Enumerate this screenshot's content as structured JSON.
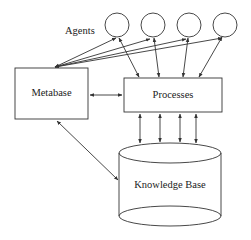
{
  "diagram": {
    "title": "",
    "nodes": {
      "agents_label": "Agents",
      "metabase": "Metabase",
      "processes": "Processes",
      "knowledge_base": "Knowledge Base"
    },
    "agents_count": 4,
    "edges": [
      {
        "from": "Metabase",
        "to": "Agent 1",
        "bidirectional": true
      },
      {
        "from": "Metabase",
        "to": "Agent 2",
        "bidirectional": true
      },
      {
        "from": "Metabase",
        "to": "Agent 3",
        "bidirectional": true
      },
      {
        "from": "Metabase",
        "to": "Agent 4",
        "bidirectional": true
      },
      {
        "from": "Agent 1",
        "to": "Processes",
        "bidirectional": true
      },
      {
        "from": "Agent 2",
        "to": "Processes",
        "bidirectional": true
      },
      {
        "from": "Agent 3",
        "to": "Processes",
        "bidirectional": true
      },
      {
        "from": "Agent 4",
        "to": "Processes",
        "bidirectional": true
      },
      {
        "from": "Metabase",
        "to": "Processes",
        "bidirectional": true
      },
      {
        "from": "Processes",
        "to": "Knowledge Base",
        "bidirectional": true,
        "count": 4
      },
      {
        "from": "Metabase",
        "to": "Knowledge Base",
        "bidirectional": true
      }
    ],
    "colors": {
      "stroke": "#333333",
      "background": "#ffffff"
    }
  }
}
